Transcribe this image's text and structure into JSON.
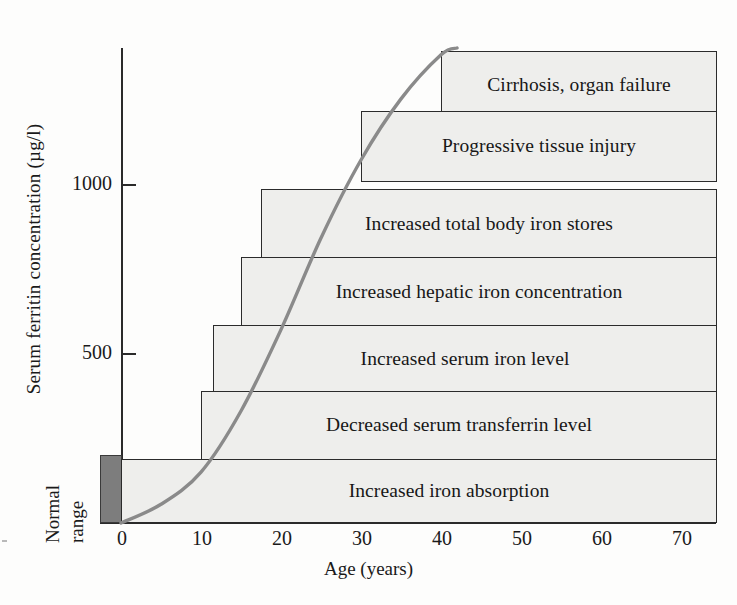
{
  "chart_data": {
    "type": "bar",
    "title": "",
    "xlabel": "Age (years)",
    "ylabel": "Serum ferritin concentration (µg/l)",
    "xlim": [
      0,
      77
    ],
    "ylim": [
      0,
      1400
    ],
    "xticks": [
      0,
      10,
      20,
      30,
      40,
      50,
      60,
      70
    ],
    "xtick_labels": [
      "0",
      "10",
      "20",
      "30",
      "40",
      "50",
      "60",
      "70"
    ],
    "yticks": [
      500,
      1000
    ],
    "ytick_labels": [
      "500",
      "1000"
    ],
    "grid": false,
    "legend": "none",
    "orientation": "horizontal",
    "note": "Horizontal stage bars showing age of onset (bar left edge) for successive clinical features of haemochromatosis, with a sigmoid curve of serum ferritin versus age.",
    "categories": [
      "Cirrhosis, organ failure",
      "Progressive tissue injury",
      "Increased total body iron stores",
      "Increased hepatic iron concentration",
      "Increased serum iron level",
      "Decreased serum transferrin level",
      "Increased iron absorption"
    ],
    "bars": [
      {
        "label": "Cirrhosis, organ failure",
        "x_start": 40,
        "x_end": 74.5,
        "y_center": 1290,
        "y_top": 1390,
        "y_bottom": 1190
      },
      {
        "label": "Progressive tissue injury",
        "x_start": 30,
        "x_end": 74.5,
        "y_center": 1110,
        "y_top": 1215,
        "y_bottom": 1005
      },
      {
        "label": "Increased total body iron stores",
        "x_start": 17.5,
        "x_end": 74.5,
        "y_center": 880,
        "y_top": 985,
        "y_bottom": 775
      },
      {
        "label": "Increased hepatic iron concentration",
        "x_start": 15,
        "x_end": 74.5,
        "y_center": 680,
        "y_top": 785,
        "y_bottom": 575
      },
      {
        "label": "Increased serum iron level",
        "x_start": 11.5,
        "x_end": 74.5,
        "y_center": 485,
        "y_top": 585,
        "y_bottom": 380
      },
      {
        "label": "Decreased serum transferrin level",
        "x_start": 10,
        "x_end": 74.5,
        "y_center": 290,
        "y_top": 390,
        "y_bottom": 185
      },
      {
        "label": "Increased iron absorption",
        "x_start": 0,
        "x_end": 74.5,
        "y_center": 95,
        "y_top": 190,
        "y_bottom": 0
      }
    ],
    "series": [
      {
        "name": "Serum ferritin concentration",
        "type": "line",
        "color": "#8a8a8a",
        "x": [
          0,
          5,
          10,
          15,
          20,
          25,
          30,
          35,
          40,
          42
        ],
        "y": [
          0,
          55,
          150,
          330,
          570,
          840,
          1070,
          1250,
          1380,
          1400
        ]
      }
    ],
    "normal_range": {
      "label_line1": "Normal",
      "label_line2": "range",
      "color": "#7d7d7d",
      "y_min": 0,
      "y_max": 200
    }
  },
  "axes": {
    "y_title": "Serum ferritin concentration (µg/l)",
    "x_title": "Age (years)",
    "y_tick_1000": "1000",
    "y_tick_500": "500"
  },
  "normal_range_text": {
    "line1": "Normal",
    "line2": "range"
  },
  "bar_labels": {
    "b0": "Cirrhosis, organ failure",
    "b1": "Progressive tissue injury",
    "b2": "Increased total body iron stores",
    "b3": "Increased hepatic iron concentration",
    "b4": "Increased serum iron level",
    "b5": "Decreased serum transferrin level",
    "b6": "Increased iron absorption"
  },
  "x_tick_labels": {
    "t0": "0",
    "t1": "10",
    "t2": "20",
    "t3": "30",
    "t4": "40",
    "t5": "50",
    "t6": "60",
    "t7": "70"
  },
  "colors": {
    "bar_fill": "#eeeeec",
    "bar_stroke": "#2b2b2b",
    "curve": "#8a8a8a",
    "normal_range": "#7d7d7d",
    "axis": "#2a2a2a",
    "background": "#fdfdfc"
  }
}
